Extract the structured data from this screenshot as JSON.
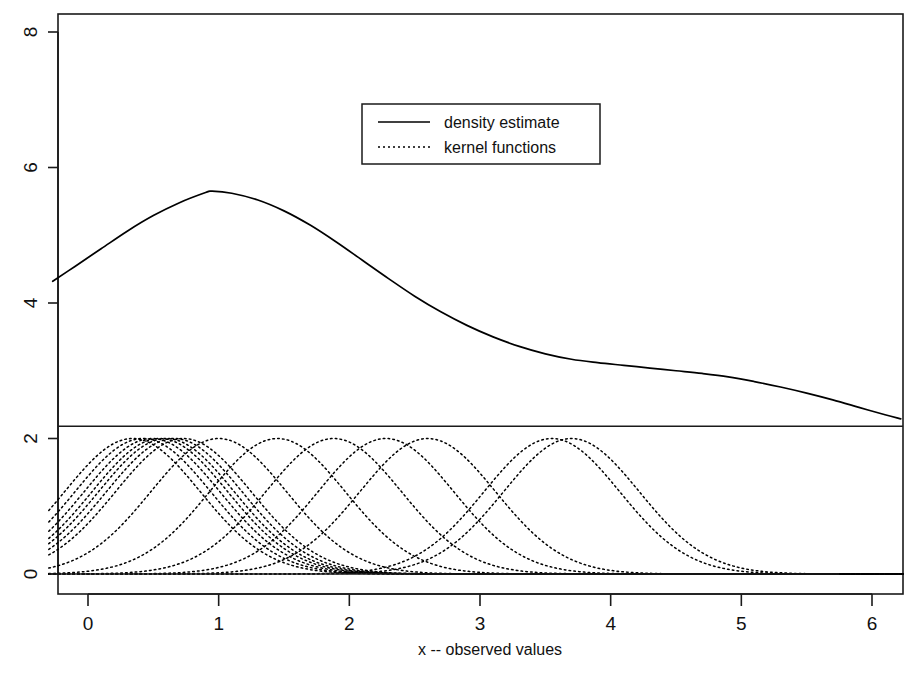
{
  "chart_data": {
    "type": "line",
    "title": "",
    "subtitle": "",
    "xlabel": "x -- observed values",
    "ylabel": "",
    "xlim": [
      -0.3,
      6.25
    ],
    "ylim": [
      -0.12,
      8.55
    ],
    "xticks": [
      0,
      1,
      2,
      3,
      4,
      5,
      6
    ],
    "xticklabels": [
      "0",
      "1",
      "2",
      "3",
      "4",
      "5",
      "6"
    ],
    "yticks": [
      0,
      2,
      4,
      6,
      8
    ],
    "yticklabels": [
      "0",
      "2",
      "4",
      "6",
      "8"
    ],
    "grid": false,
    "legend_position": "top-center-right",
    "legend": [
      {
        "label": "density estimate",
        "style": "solid"
      },
      {
        "label": "kernel functions",
        "style": "dotted"
      }
    ],
    "annotations": [
      {
        "name": "panel-separator-line",
        "type": "hline",
        "y": 2.18
      },
      {
        "name": "kernel-baseline-line",
        "type": "hline",
        "y": 0.0,
        "x_start": -0.3,
        "x_end": 5.75
      }
    ],
    "series": [
      {
        "name": "density estimate",
        "style": "solid",
        "color": "#000000",
        "x": [
          -0.27,
          -0.1,
          0.1,
          0.3,
          0.5,
          0.7,
          0.9,
          0.95,
          1.1,
          1.3,
          1.5,
          1.7,
          1.9,
          2.1,
          2.3,
          2.5,
          2.7,
          2.9,
          3.1,
          3.3,
          3.5,
          3.7,
          3.9,
          4.1,
          4.3,
          4.5,
          4.7,
          4.9,
          5.1,
          5.3,
          5.5,
          5.7,
          5.9,
          6.1,
          6.22
        ],
        "y": [
          4.32,
          4.54,
          4.8,
          5.06,
          5.29,
          5.48,
          5.63,
          5.65,
          5.62,
          5.52,
          5.36,
          5.15,
          4.9,
          4.63,
          4.36,
          4.1,
          3.87,
          3.67,
          3.5,
          3.36,
          3.25,
          3.17,
          3.12,
          3.08,
          3.04,
          3.0,
          2.96,
          2.91,
          2.84,
          2.76,
          2.67,
          2.57,
          2.46,
          2.35,
          2.29
        ]
      },
      {
        "name": "kernel functions",
        "style": "dotted",
        "color": "#000000",
        "description": "Gaussian kernels, each with peak height 2.0 and bandwidth sigma 0.52, centred on each observed value",
        "peak_height": 2.0,
        "bandwidth_sigma": 0.52,
        "centers": [
          0.34,
          0.42,
          0.49,
          0.55,
          0.6,
          0.66,
          0.73,
          1.0,
          1.45,
          1.88,
          2.28,
          2.6,
          3.55,
          3.7
        ]
      }
    ]
  },
  "figure": {
    "background_color": "#ffffff",
    "line_color": "#000000",
    "panel_border": true
  }
}
